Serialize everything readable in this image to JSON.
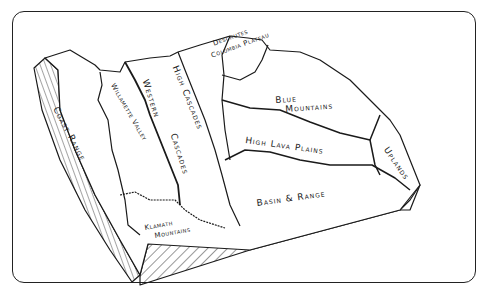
{
  "diagram": {
    "type": "block-diagram",
    "style": {
      "ink": "#1a1a1a",
      "paper": "#ffffff",
      "frame": "#222222"
    },
    "regions": [
      {
        "id": "coast-range",
        "label": "Coast Range"
      },
      {
        "id": "willamette-valley",
        "label": "Willamette Valley"
      },
      {
        "id": "western-cascades",
        "label_line1": "Western",
        "label_line2": "Cascades"
      },
      {
        "id": "high-cascades",
        "label": "High Cascades"
      },
      {
        "id": "deschutes-columbia-plateau",
        "label_line1": "Deschutes",
        "label_line2": "Columbia Plateau"
      },
      {
        "id": "blue-mountains",
        "label_line1": "Blue",
        "label_line2": "Mountains"
      },
      {
        "id": "high-lava-plains",
        "label": "High Lava Plains"
      },
      {
        "id": "owyhee-uplands",
        "label": "Uplands"
      },
      {
        "id": "basin-and-range",
        "label": "Basin & Range"
      },
      {
        "id": "klamath-mountains",
        "label_line1": "Klamath",
        "label_line2": "Mountains"
      }
    ]
  }
}
